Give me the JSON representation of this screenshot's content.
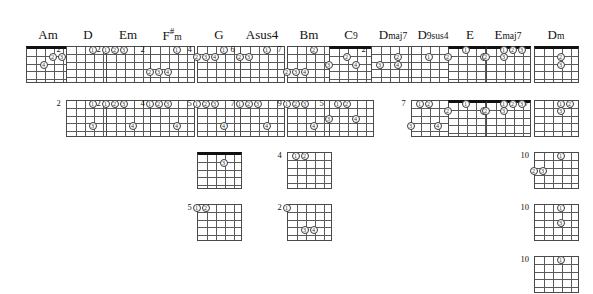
{
  "page": {
    "kind": "guitar-chord-chart",
    "background": "#ffffff",
    "ink": "#111111",
    "string_count": 6,
    "fret_count": 5
  },
  "columns": [
    {
      "name": "Am",
      "name_html": "Am",
      "x": 48,
      "diagrams": [
        {
          "row": 0,
          "fret_label": "",
          "nut": true,
          "dots": [
            {
              "string": 3,
              "fret": 2,
              "finger": "2"
            },
            {
              "string": 2,
              "fret": 2,
              "finger": "3"
            },
            {
              "string": 4,
              "fret": 3,
              "finger": "4"
            }
          ]
        }
      ]
    },
    {
      "name": "D",
      "name_html": "D",
      "x": 88,
      "diagrams": [
        {
          "row": 0,
          "fret_label": "2",
          "nut": false,
          "dots": [
            {
              "string": 3,
              "fret": 1,
              "finger": "1"
            }
          ]
        },
        {
          "row": 1,
          "fret_label": "2",
          "nut": false,
          "dots": [
            {
              "string": 3,
              "fret": 1,
              "finger": "1"
            },
            {
              "string": 3,
              "fret": 4,
              "finger": "3"
            }
          ]
        }
      ]
    },
    {
      "name": "Em",
      "name_html": "Em",
      "x": 128,
      "diagrams": [
        {
          "row": 0,
          "fret_label": "2",
          "nut": false,
          "dots": [
            {
              "string": 6,
              "fret": 1,
              "finger": "1"
            },
            {
              "string": 5,
              "fret": 1,
              "finger": "2"
            },
            {
              "string": 4,
              "fret": 1,
              "finger": "3"
            }
          ]
        },
        {
          "row": 1,
          "fret_label": "2",
          "nut": false,
          "dots": [
            {
              "string": 6,
              "fret": 1,
              "finger": "1"
            },
            {
              "string": 5,
              "fret": 1,
              "finger": "2"
            },
            {
              "string": 4,
              "fret": 1,
              "finger": "3"
            },
            {
              "string": 3,
              "fret": 4,
              "finger": "4"
            }
          ]
        }
      ]
    },
    {
      "name": "F#m",
      "name_html": "F<span class=\"sharp\">#</span><span class=\"sub\">m</span>",
      "x": 172,
      "diagrams": [
        {
          "row": 0,
          "fret_label": "2",
          "nut": false,
          "dots": [
            {
              "string": 3,
              "fret": 1,
              "finger": "1"
            },
            {
              "string": 6,
              "fret": 4,
              "finger": "2"
            },
            {
              "string": 5,
              "fret": 4,
              "finger": "3"
            },
            {
              "string": 4,
              "fret": 4,
              "finger": "4"
            }
          ]
        },
        {
          "row": 1,
          "fret_label": "4",
          "nut": false,
          "dots": [
            {
              "string": 6,
              "fret": 1,
              "finger": "1"
            },
            {
              "string": 5,
              "fret": 1,
              "finger": "2"
            },
            {
              "string": 4,
              "fret": 1,
              "finger": "3"
            },
            {
              "string": 3,
              "fret": 4,
              "finger": "4"
            }
          ]
        }
      ]
    },
    {
      "name": "G",
      "name_html": "G",
      "x": 219,
      "diagrams": [
        {
          "row": 0,
          "fret_label": "4",
          "nut": false,
          "dots": [
            {
              "string": 3,
              "fret": 1,
              "finger": "1"
            },
            {
              "string": 6,
              "fret": 2,
              "finger": "2"
            },
            {
              "string": 5,
              "fret": 2,
              "finger": "3"
            },
            {
              "string": 4,
              "fret": 2,
              "finger": "4"
            }
          ]
        },
        {
          "row": 1,
          "fret_label": "5",
          "nut": false,
          "dots": [
            {
              "string": 6,
              "fret": 1,
              "finger": "1"
            },
            {
              "string": 5,
              "fret": 1,
              "finger": "2"
            },
            {
              "string": 4,
              "fret": 1,
              "finger": "3"
            },
            {
              "string": 3,
              "fret": 4,
              "finger": "4"
            }
          ]
        },
        {
          "row": 2,
          "fret_label": "",
          "nut": true,
          "dots": [
            {
              "string": 3,
              "fret": 2,
              "finger": "3"
            }
          ]
        },
        {
          "row": 3,
          "fret_label": "5",
          "nut": false,
          "dots": [
            {
              "string": 6,
              "fret": 1,
              "finger": "1"
            },
            {
              "string": 5,
              "fret": 1,
              "finger": "2"
            }
          ]
        }
      ]
    },
    {
      "name": "Asus4",
      "name_html": "Asus4",
      "x": 262,
      "diagrams": [
        {
          "row": 0,
          "fret_label": "6",
          "nut": false,
          "dots": [
            {
              "string": 3,
              "fret": 1,
              "finger": "1"
            },
            {
              "string": 6,
              "fret": 2,
              "finger": "2"
            },
            {
              "string": 5,
              "fret": 2,
              "finger": "3"
            }
          ]
        },
        {
          "row": 1,
          "fret_label": "7",
          "nut": false,
          "dots": [
            {
              "string": 6,
              "fret": 1,
              "finger": "1"
            },
            {
              "string": 5,
              "fret": 1,
              "finger": "2"
            },
            {
              "string": 4,
              "fret": 1,
              "finger": "3"
            },
            {
              "string": 3,
              "fret": 4,
              "finger": "4"
            }
          ]
        }
      ]
    },
    {
      "name": "Bm",
      "name_html": "Bm",
      "x": 309,
      "diagrams": [
        {
          "row": 0,
          "fret_label": "7",
          "nut": false,
          "dots": [
            {
              "string": 3,
              "fret": 1,
              "finger": "2"
            },
            {
              "string": 6,
              "fret": 4,
              "finger": "2"
            },
            {
              "string": 5,
              "fret": 4,
              "finger": "3"
            },
            {
              "string": 4,
              "fret": 4,
              "finger": "4"
            }
          ]
        },
        {
          "row": 1,
          "fret_label": "9",
          "nut": false,
          "dots": [
            {
              "string": 6,
              "fret": 1,
              "finger": "1"
            },
            {
              "string": 5,
              "fret": 1,
              "finger": "2"
            },
            {
              "string": 4,
              "fret": 1,
              "finger": "3"
            },
            {
              "string": 3,
              "fret": 4,
              "finger": "4"
            }
          ]
        },
        {
          "row": 2,
          "fret_label": "4",
          "nut": false,
          "dots": [
            {
              "string": 5,
              "fret": 1,
              "finger": "1"
            },
            {
              "string": 4,
              "fret": 1,
              "finger": "2"
            }
          ]
        },
        {
          "row": 3,
          "fret_label": "2",
          "nut": false,
          "dots": [
            {
              "string": 6,
              "fret": 1,
              "finger": "1"
            },
            {
              "string": 4,
              "fret": 4,
              "finger": "3"
            },
            {
              "string": 3,
              "fret": 4,
              "finger": "4"
            }
          ]
        }
      ]
    },
    {
      "name": "C9",
      "name_html": "C<span class=\"sub\">9</span>",
      "x": 351,
      "diagrams": [
        {
          "row": 0,
          "fret_label": "",
          "nut": true,
          "dots": [
            {
              "string": 4,
              "fret": 2,
              "finger": "2"
            },
            {
              "string": 6,
              "fret": 3,
              "finger": "3"
            },
            {
              "string": 3,
              "fret": 3,
              "finger": "4"
            }
          ]
        },
        {
          "row": 1,
          "fret_label": "5",
          "nut": false,
          "dots": [
            {
              "string": 5,
              "fret": 1,
              "finger": "1"
            },
            {
              "string": 4,
              "fret": 1,
              "finger": "2"
            },
            {
              "string": 6,
              "fret": 3,
              "finger": "3"
            },
            {
              "string": 3,
              "fret": 3,
              "finger": "4"
            }
          ]
        }
      ]
    },
    {
      "name": "Dmaj7",
      "name_html": "D<span class=\"sub\">maj7</span>",
      "x": 393,
      "diagrams": [
        {
          "row": 0,
          "fret_label": "2",
          "nut": false,
          "dots": [
            {
              "string": 3,
              "fret": 2,
              "finger": "2"
            },
            {
              "string": 5,
              "fret": 3,
              "finger": "3"
            },
            {
              "string": 3,
              "fret": 3,
              "finger": "4"
            }
          ]
        }
      ]
    },
    {
      "name": "D9sus4",
      "name_html": "D<span class=\"sub\">9sus4</span>",
      "x": 433,
      "diagrams": [
        {
          "row": 0,
          "fret_label": "",
          "nut": false,
          "dots": [
            {
              "string": 4,
              "fret": 2,
              "finger": "1"
            }
          ]
        },
        {
          "row": 1,
          "fret_label": "7",
          "nut": false,
          "dots": [
            {
              "string": 5,
              "fret": 1,
              "finger": "1"
            },
            {
              "string": 4,
              "fret": 1,
              "finger": "2"
            },
            {
              "string": 6,
              "fret": 4,
              "finger": "3"
            },
            {
              "string": 3,
              "fret": 4,
              "finger": "4"
            }
          ]
        }
      ]
    },
    {
      "name": "E",
      "name_html": "E",
      "x": 470,
      "diagrams": [
        {
          "row": 0,
          "fret_label": "",
          "nut": true,
          "dots": [
            {
              "string": 4,
              "fret": 1,
              "finger": "1"
            },
            {
              "string": 6,
              "fret": 2,
              "finger": "2"
            },
            {
              "string": 2,
              "fret": 2,
              "finger": "3"
            },
            {
              "string": 1,
              "fret": 2,
              "finger": "4"
            }
          ]
        },
        {
          "row": 1,
          "fret_label": "",
          "nut": true,
          "dots": [
            {
              "string": 4,
              "fret": 1,
              "finger": "1"
            },
            {
              "string": 6,
              "fret": 2,
              "finger": "2"
            },
            {
              "string": 2,
              "fret": 2,
              "finger": "3"
            },
            {
              "string": 1,
              "fret": 2,
              "finger": "4"
            }
          ]
        }
      ]
    },
    {
      "name": "Emaj7",
      "name_html": "E<span class=\"sub\">maj7</span>",
      "x": 508,
      "diagrams": [
        {
          "row": 0,
          "fret_label": "",
          "nut": true,
          "dots": [
            {
              "string": 4,
              "fret": 1,
              "finger": "1"
            },
            {
              "string": 3,
              "fret": 1,
              "finger": "2"
            },
            {
              "string": 2,
              "fret": 1,
              "finger": "3"
            },
            {
              "string": 6,
              "fret": 2,
              "finger": "2"
            },
            {
              "string": 4,
              "fret": 2,
              "finger": "3"
            }
          ]
        },
        {
          "row": 1,
          "fret_label": "",
          "nut": true,
          "dots": [
            {
              "string": 4,
              "fret": 1,
              "finger": "1"
            },
            {
              "string": 3,
              "fret": 1,
              "finger": "2"
            },
            {
              "string": 2,
              "fret": 1,
              "finger": "3"
            },
            {
              "string": 6,
              "fret": 2,
              "finger": "2"
            },
            {
              "string": 4,
              "fret": 2,
              "finger": "3"
            }
          ]
        }
      ]
    },
    {
      "name": "Dm",
      "name_html": "D<span class=\"sub\">m</span>",
      "x": 556,
      "diagrams": [
        {
          "row": 0,
          "fret_label": "",
          "nut": true,
          "dots": [
            {
              "string": 3,
              "fret": 2,
              "finger": "2"
            },
            {
              "string": 3,
              "fret": 3,
              "finger": "3"
            }
          ]
        },
        {
          "row": 1,
          "fret_label": "7",
          "nut": false,
          "dots": [
            {
              "string": 3,
              "fret": 1,
              "finger": "1"
            },
            {
              "string": 2,
              "fret": 1,
              "finger": "2"
            },
            {
              "string": 3,
              "fret": 2,
              "finger": "3"
            }
          ]
        },
        {
          "row": 2,
          "fret_label": "10",
          "nut": false,
          "dots": [
            {
              "string": 3,
              "fret": 1,
              "finger": "1"
            },
            {
              "string": 6,
              "fret": 3,
              "finger": "2"
            },
            {
              "string": 5,
              "fret": 3,
              "finger": "3"
            }
          ]
        },
        {
          "row": 3,
          "fret_label": "10",
          "nut": false,
          "dots": [
            {
              "string": 3,
              "fret": 1,
              "finger": "1"
            },
            {
              "string": 3,
              "fret": 3,
              "finger": "3"
            }
          ]
        },
        {
          "row": 4,
          "fret_label": "10",
          "nut": false,
          "dots": [
            {
              "string": 3,
              "fret": 1,
              "finger": "1"
            }
          ]
        }
      ]
    }
  ],
  "row_tops": [
    46,
    100,
    152,
    204,
    256
  ]
}
